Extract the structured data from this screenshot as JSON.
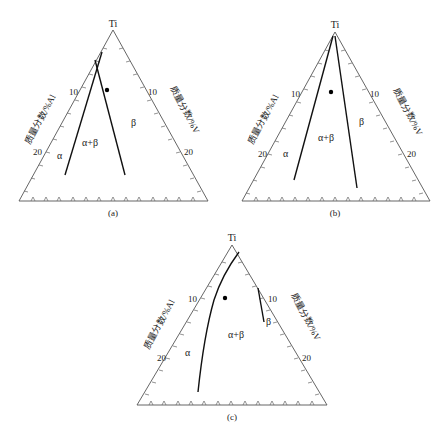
{
  "figure": {
    "panels": [
      {
        "id": "a",
        "caption": "(a)",
        "apex_label": "Ti",
        "left_axis_label": "质量分数/%Al",
        "right_axis_label": "质量分数/%V",
        "left_ticks": [
          "10",
          "20"
        ],
        "right_ticks": [
          "10",
          "20"
        ],
        "regions": [
          "α",
          "α+β",
          "β"
        ]
      },
      {
        "id": "b",
        "caption": "(b)",
        "apex_label": "Ti",
        "left_axis_label": "质量分数/%Al",
        "right_axis_label": "质量分数/%V",
        "left_ticks": [
          "10",
          "20"
        ],
        "right_ticks": [
          "10",
          "20"
        ],
        "regions": [
          "α",
          "α+β",
          "β"
        ]
      },
      {
        "id": "c",
        "caption": "(c)",
        "apex_label": "Ti",
        "left_axis_label": "质量分数/%Al",
        "right_axis_label": "质量分数/%V",
        "left_ticks": [
          "10",
          "20"
        ],
        "right_ticks": [
          "10",
          "20"
        ],
        "regions": [
          "α",
          "α+β",
          "β"
        ]
      }
    ]
  }
}
